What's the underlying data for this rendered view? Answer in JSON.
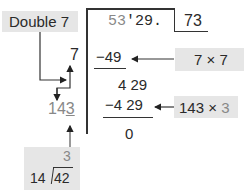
{
  "dividend": {
    "grey_part": "53",
    "black_part": "'29."
  },
  "root": "73",
  "steps": {
    "sub1": "−49",
    "remainder1": "4 29",
    "sub2": "−4 29",
    "remainder2": "0"
  },
  "side_work": {
    "first_digit": "7",
    "trial_divisor_prefix": "14",
    "trial_divisor_suffix": "3"
  },
  "annotations": {
    "double": "Double 7",
    "seven_times": "7 × 7",
    "trial_product_base": "143 × ",
    "trial_product_digit": "3"
  },
  "mini_division": {
    "quotient": "3",
    "divisor": "14",
    "dividend": "42"
  },
  "colors": {
    "box_fill": "#e6e6e6",
    "ink": "#2a2a2a",
    "light_ink": "#888888"
  }
}
